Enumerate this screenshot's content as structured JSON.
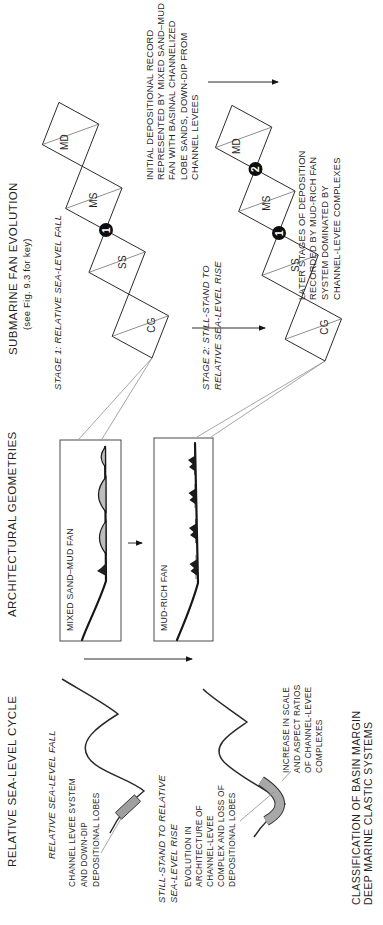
{
  "figure": {
    "caption": [
      "CLASSIFICATION OF BASIN MARGIN",
      "DEEP MARINE CLASTIC SYSTEMS"
    ],
    "colors": {
      "ink": "#222222",
      "marker_gray": "#9f9f9f",
      "lobe_gray": "#bdbdbd"
    },
    "sea_level": {
      "title": "RELATIVE SEA-LEVEL CYCLE",
      "stage1_label": "RELATIVE SEA-LEVEL FALL",
      "stage2_label": [
        "STILL-STAND TO RELATIVE",
        "SEA-LEVEL RISE"
      ],
      "stage1_annotation": [
        "CHANNEL LEVEE SYSTEM",
        "AND DOWN-DIP",
        "DEPOSITIONAL LOBES"
      ],
      "stage2_annotation": [
        "EVOLUTION IN",
        "ARCHITECTURE OF",
        "CHANNEL-LEVEE",
        "COMPLEX AND LOSS OF",
        "DEPOSITIONAL LOBES"
      ],
      "stage2_annotation_right": [
        "INCREASE IN SCALE",
        "AND ASPECT RATIOS",
        "OF CHANNEL-LEVEE",
        "COMPLEXES"
      ]
    },
    "architecture": {
      "title": "ARCHITECTURAL GEOMETRIES",
      "box1_label": "MIXED SAND–MUD FAN",
      "box2_label": "MUD-RICH FAN"
    },
    "fan_evolution": {
      "title": "SUBMARINE FAN EVOLUTION",
      "subtitle": "(see Fig. 9.3 for key)",
      "stage1_caption": "STAGE 1: RELATIVE SEA-LEVEL FALL",
      "stage2_caption": [
        "STAGE 2: STILL-STAND TO",
        "RELATIVE SEA-LEVEL RISE"
      ],
      "facies_labels": [
        "CG",
        "SS",
        "MS",
        "MD"
      ],
      "badges": {
        "one": "1",
        "two": "2"
      },
      "stage1_note": [
        "INITIAL DEPOSITIONAL RECORD",
        "REPRESENTED BY MIXED SAND–MUD",
        "FAN WITH BASINAL CHANNELIZED",
        "LOBE SANDS, DOWN-DIP FROM",
        "CHANNEL LEVEES"
      ],
      "stage2_note": [
        "LATER STAGES OF DEPOSITION",
        "RECORDED BY MUD-RICH FAN",
        "SYSTEM DOMINATED BY",
        "CHANNEL-LEVEE COMPLEXES"
      ]
    }
  }
}
